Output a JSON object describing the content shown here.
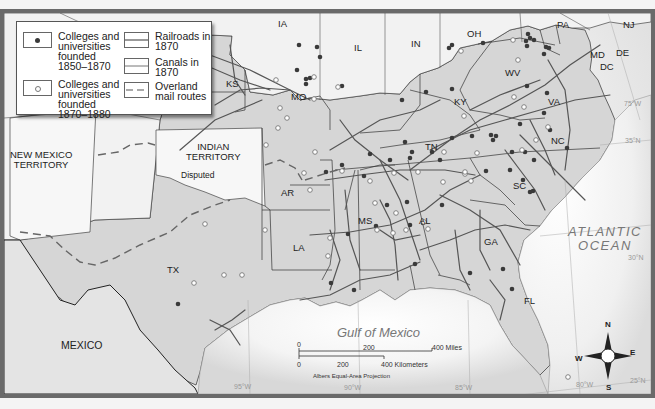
{
  "legend": {
    "items": [
      {
        "symbol": "filled-dot",
        "label": "Colleges and\nuniversities\nfounded\n1850–1870"
      },
      {
        "symbol": "open-dot",
        "label": "Colleges and\nuniversities\nfounded\n1870–1880"
      },
      {
        "symbol": "double-line",
        "label": "Railroads in\n1870"
      },
      {
        "symbol": "single-line",
        "label": "Canals in\n1870"
      },
      {
        "symbol": "dashed-line",
        "label": "Overland\nmail routes"
      }
    ]
  },
  "regions": {
    "ia": "IA",
    "il": "IL",
    "in": "IN",
    "oh": "OH",
    "pa": "PA",
    "nj": "NJ",
    "md": "MD",
    "de": "DE",
    "dc": "DC",
    "wv": "WV",
    "ks": "KS",
    "mo": "MO",
    "ky": "KY",
    "va": "VA",
    "nc": "NC",
    "tn": "TN",
    "sc": "SC",
    "ar": "AR",
    "ms": "MS",
    "al": "AL",
    "ga": "GA",
    "la": "LA",
    "tx": "TX",
    "fl": "FL",
    "new_mexico": "NEW MEXICO\nTERRITORY",
    "indian_territory": "INDIAN\nTERRITORY",
    "disputed": "Disputed",
    "mexico": "MEXICO"
  },
  "water": {
    "atlantic": "ATLANTIC\nOCEAN",
    "gulf": "Gulf of Mexico"
  },
  "grid": {
    "lon_95": "95°W",
    "lon_90": "90°W",
    "lon_85": "85°W",
    "lon_80": "80°W",
    "lon_75": "75°W",
    "lat_35": "35°N",
    "lat_30": "30°N",
    "lat_25": "25°N"
  },
  "scale": {
    "miles_0": "0",
    "miles_200": "200",
    "miles_400": "400 Miles",
    "km_0": "0",
    "km_200": "200",
    "km_400": "400 Kilometers",
    "projection": "Albers Equal-Area Projection"
  },
  "compass": {
    "n": "N",
    "s": "S",
    "e": "E",
    "w": "W"
  },
  "colors": {
    "land_south": "#d4d4d4",
    "land_other": "#f0f0f0",
    "water": "#ffffff",
    "frame": "#6a6a6a",
    "rail": "#555555",
    "dot_filled": "#3a3a3a"
  }
}
